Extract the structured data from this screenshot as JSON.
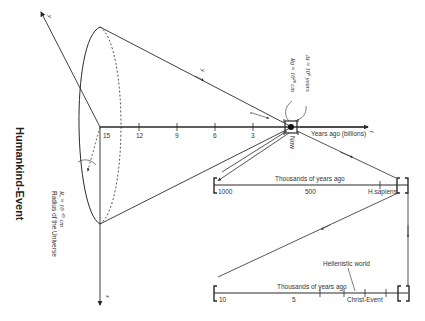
{
  "title": "Humankind-Event",
  "cone": {
    "radius_label": "R₀ ≈ 10⁻²⁹ cm",
    "radius_caption": "Radius of the Universe",
    "axis_y": "y",
    "axis_x": "x",
    "axis_t": "t",
    "generator_label": "y"
  },
  "main_axis": {
    "label": "Years ago (billions)",
    "ticks": [
      "15",
      "12",
      "9",
      "6",
      "3"
    ],
    "now_label": "Now",
    "annot_rg": "Rɡ ≈ 10²⁸ cm",
    "annot_dt": "Δt ≈ 10⁶ years"
  },
  "timeline_1": {
    "title": "Thousands of years ago",
    "ticks": [
      "1000",
      "500",
      "H.sapiens"
    ]
  },
  "timeline_2": {
    "title": "Thousands of years ago",
    "ticks": [
      "10",
      "5",
      "Christ-Event"
    ],
    "annotation": "Hellenistic world"
  },
  "colors": {
    "line": "#2a2a2a",
    "text": "#333333",
    "background": "#ffffff"
  }
}
